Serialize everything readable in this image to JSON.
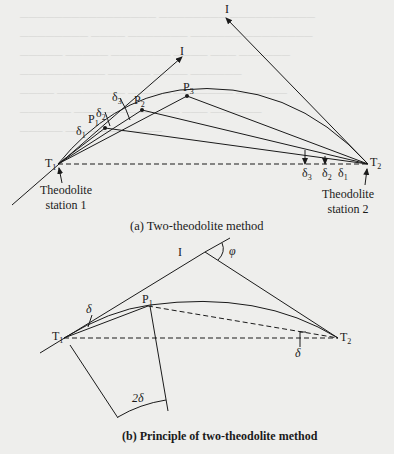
{
  "figure_a": {
    "caption": "(a) Two-theodolite method",
    "points": {
      "T1": "T",
      "T1_sub": "1",
      "T2": "T",
      "T2_sub": "2",
      "I_top_left": "I",
      "I_top_right": "I",
      "P1": "P",
      "P1_sub": "1",
      "P2": "P",
      "P2_sub": "2",
      "P3": "P",
      "P3_sub": "3"
    },
    "angles_at_T1": [
      {
        "sym": "δ",
        "sub": "1"
      },
      {
        "sym": "δ",
        "sub": "2"
      },
      {
        "sym": "δ",
        "sub": "3"
      }
    ],
    "angles_at_T2": [
      {
        "sym": "δ",
        "sub": "3"
      },
      {
        "sym": "δ",
        "sub": "2"
      },
      {
        "sym": "δ",
        "sub": "1"
      }
    ],
    "station1": {
      "line1": "Theodolite",
      "line2": "station 1"
    },
    "station2": {
      "line1": "Theodolite",
      "line2": "station 2"
    }
  },
  "figure_b": {
    "caption": "(b) Principle of two-theodolite method",
    "points": {
      "T1": "T",
      "T1_sub": "1",
      "T2": "T",
      "T2_sub": "2",
      "I": "I",
      "P1": "P",
      "P1_sub": "1"
    },
    "angle_delta": "δ",
    "angle_delta_T2": "δ",
    "angle_phi": "φ",
    "arc_label": "2δ"
  },
  "colors": {
    "background": "#eeeeec",
    "line": "#1a1a1a"
  }
}
